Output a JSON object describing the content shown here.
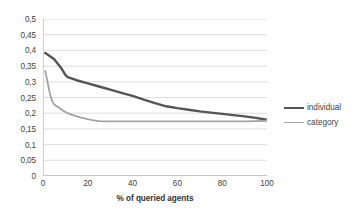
{
  "chart_data": {
    "type": "line",
    "title": "",
    "xlabel": "% of queried agents",
    "ylabel": "",
    "xlim": [
      0,
      100
    ],
    "ylim": [
      0,
      0.5
    ],
    "grid": true,
    "legend_position": "right",
    "decimal_separator": ",",
    "x_ticks": [
      0,
      20,
      40,
      60,
      80,
      100
    ],
    "x_tick_labels": [
      "0",
      "20",
      "40",
      "60",
      "80",
      "100"
    ],
    "y_ticks": [
      0,
      0.05,
      0.1,
      0.15,
      0.2,
      0.25,
      0.3,
      0.35,
      0.4,
      0.45,
      0.5
    ],
    "y_tick_labels": [
      "0",
      "0,05",
      "0,1",
      "0,15",
      "0,2",
      "0,25",
      "0,3",
      "0,35",
      "0,4",
      "0,45",
      "0,5"
    ],
    "series": [
      {
        "name": "individual",
        "color": "#555555",
        "width": 2.4,
        "x": [
          1,
          3,
          5,
          8,
          10,
          11,
          15,
          20,
          25,
          30,
          35,
          40,
          45,
          50,
          55,
          60,
          65,
          70,
          75,
          80,
          85,
          90,
          95,
          100
        ],
        "values": [
          0.392,
          0.382,
          0.372,
          0.345,
          0.322,
          0.315,
          0.305,
          0.295,
          0.285,
          0.275,
          0.265,
          0.255,
          0.243,
          0.232,
          0.222,
          0.216,
          0.211,
          0.206,
          0.202,
          0.198,
          0.194,
          0.19,
          0.185,
          0.179
        ]
      },
      {
        "name": "category",
        "color": "#a3a3a3",
        "width": 1.8,
        "x": [
          1,
          2,
          3,
          4,
          5,
          7,
          9,
          11,
          14,
          17,
          20,
          22,
          25,
          30,
          40,
          50,
          60,
          70,
          80,
          90,
          95,
          100
        ],
        "values": [
          0.335,
          0.3,
          0.265,
          0.24,
          0.228,
          0.218,
          0.208,
          0.2,
          0.192,
          0.186,
          0.181,
          0.178,
          0.175,
          0.174,
          0.174,
          0.174,
          0.174,
          0.174,
          0.174,
          0.174,
          0.175,
          0.176
        ]
      }
    ]
  },
  "legend": {
    "items": [
      {
        "label": "individual"
      },
      {
        "label": "category"
      }
    ]
  },
  "axes": {
    "x_title": "% of queried agents"
  }
}
